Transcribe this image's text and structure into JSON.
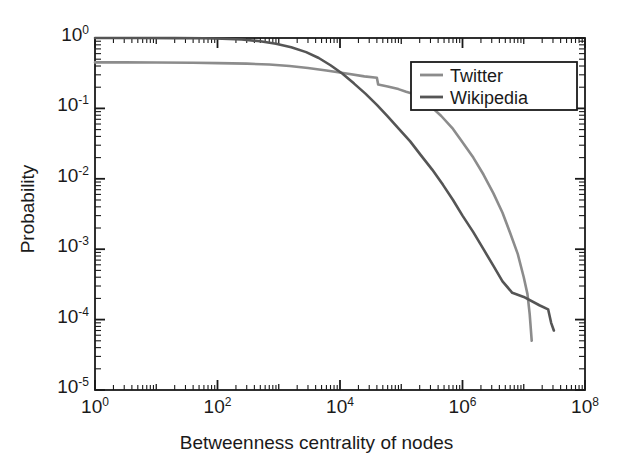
{
  "chart_data": {
    "type": "line",
    "title": "",
    "xlabel": "Betweenness centrality of nodes",
    "ylabel": "Probability",
    "xscale": "log",
    "yscale": "log",
    "xlim": [
      1,
      100000000
    ],
    "ylim": [
      1e-05,
      1
    ],
    "grid": false,
    "legend_position": "upper right",
    "xtick_labels": [
      "10",
      "10",
      "10",
      "10",
      "10"
    ],
    "xtick_exponents": [
      "0",
      "2",
      "4",
      "6",
      "8"
    ],
    "xtick_values": [
      1,
      100,
      10000,
      1000000,
      100000000
    ],
    "ytick_labels": [
      "10",
      "10",
      "10",
      "10",
      "10",
      "10"
    ],
    "ytick_exponents": [
      "0",
      "-1",
      "-2",
      "-3",
      "-4",
      "-5"
    ],
    "ytick_values": [
      1,
      0.1,
      0.01,
      0.001,
      0.0001,
      1e-05
    ],
    "series": [
      {
        "name": "Twitter",
        "color": "#8c8c8c",
        "points": [
          [
            1,
            0.45
          ],
          [
            3,
            0.45
          ],
          [
            10,
            0.448
          ],
          [
            40,
            0.445
          ],
          [
            100,
            0.44
          ],
          [
            300,
            0.432
          ],
          [
            700,
            0.42
          ],
          [
            1500,
            0.4
          ],
          [
            3000,
            0.375
          ],
          [
            6000,
            0.345
          ],
          [
            12000,
            0.315
          ],
          [
            25000,
            0.285
          ],
          [
            40000,
            0.272
          ],
          [
            42000,
            0.218
          ],
          [
            60000,
            0.205
          ],
          [
            90000,
            0.188
          ],
          [
            120000,
            0.172
          ],
          [
            150000,
            0.163
          ],
          [
            200000,
            0.14
          ],
          [
            300000,
            0.108
          ],
          [
            450000,
            0.078
          ],
          [
            700000,
            0.051
          ],
          [
            1000000,
            0.033
          ],
          [
            1500000,
            0.02
          ],
          [
            2200000,
            0.0115
          ],
          [
            3200000,
            0.0062
          ],
          [
            4500000,
            0.0033
          ],
          [
            6000000,
            0.0017
          ],
          [
            8000000,
            0.00085
          ],
          [
            10000000,
            0.0004
          ],
          [
            11500000,
            0.00023
          ],
          [
            12500000,
            0.00012
          ],
          [
            13500000,
            5e-05
          ]
        ]
      },
      {
        "name": "Wikipedia",
        "color": "#555555",
        "points": [
          [
            1,
            1.0
          ],
          [
            5,
            0.998
          ],
          [
            20,
            0.995
          ],
          [
            60,
            0.99
          ],
          [
            120,
            0.975
          ],
          [
            250,
            0.95
          ],
          [
            500,
            0.9
          ],
          [
            900,
            0.83
          ],
          [
            1600,
            0.74
          ],
          [
            2800,
            0.63
          ],
          [
            4500,
            0.52
          ],
          [
            7000,
            0.41
          ],
          [
            11000,
            0.31
          ],
          [
            17000,
            0.225
          ],
          [
            26000,
            0.162
          ],
          [
            40000,
            0.112
          ],
          [
            60000,
            0.077
          ],
          [
            90000,
            0.052
          ],
          [
            140000,
            0.034
          ],
          [
            210000,
            0.0215
          ],
          [
            320000,
            0.0135
          ],
          [
            480000,
            0.0082
          ],
          [
            700000,
            0.005
          ],
          [
            1000000,
            0.003
          ],
          [
            1500000,
            0.00175
          ],
          [
            2200000,
            0.001
          ],
          [
            3200000,
            0.00058
          ],
          [
            4500000,
            0.00035
          ],
          [
            6500000,
            0.00024
          ],
          [
            10000000,
            0.00021
          ],
          [
            18000000,
            0.00016
          ],
          [
            25000000,
            0.00014
          ],
          [
            28000000,
            9e-05
          ],
          [
            31000000,
            7e-05
          ]
        ]
      }
    ]
  },
  "legend": {
    "items": [
      {
        "label": "Twitter"
      },
      {
        "label": "Wikipedia"
      }
    ]
  },
  "axes": {
    "frame_color": "#1a1a1a"
  }
}
